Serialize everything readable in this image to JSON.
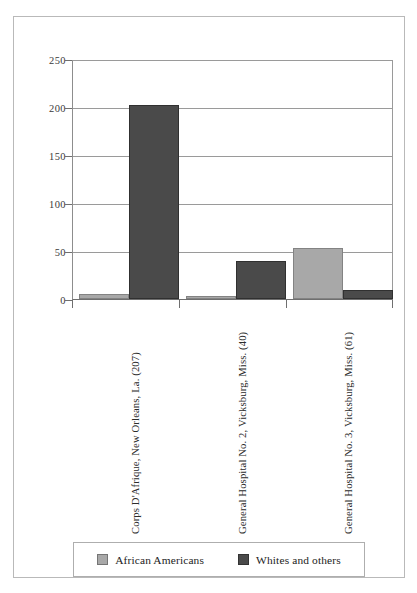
{
  "chart_data": {
    "type": "bar",
    "title": "",
    "subtitle": "",
    "xlabel": "",
    "ylabel": "",
    "ylim": [
      0,
      250
    ],
    "yticks": [
      0,
      50,
      100,
      150,
      200,
      250
    ],
    "ytick_labels": [
      "0",
      "50",
      "100",
      "150",
      "200",
      "250"
    ],
    "minor_tick_step": 10,
    "grid": true,
    "grid_axis": "y",
    "legend_position": "bottom",
    "categories": [
      "Corps D'Afrique, New Orleans, La. (207)",
      "General Hospital No. 2, Vicksburg, Miss. (40)",
      "General Hospital No. 3, Vicksburg, Miss. (61)"
    ],
    "series": [
      {
        "name": "African Americans",
        "color": "#a8a8a8",
        "values": [
          5,
          2,
          53
        ]
      },
      {
        "name": "Whites and others",
        "color": "#4a4a4a",
        "values": [
          202,
          39,
          9
        ]
      }
    ]
  },
  "legend": {
    "entries": [
      {
        "label": "African Americans",
        "color": "#a8a8a8",
        "swatch": "legend-swatch-african-americans"
      },
      {
        "label": "Whites and others",
        "color": "#4a4a4a",
        "swatch": "legend-swatch-whites-and-others"
      }
    ]
  },
  "axes": {
    "y_tick_labels": [
      "250",
      "200",
      "150",
      "100",
      "50",
      "0"
    ]
  },
  "colors": {
    "series_african_americans": "#a8a8a8",
    "series_whites_and_others": "#4a4a4a",
    "gridline": "#9a9a9a",
    "axis": "#6f6f6f",
    "frame": "#b9b9b9",
    "background": "#ffffff",
    "text": "#222222"
  }
}
